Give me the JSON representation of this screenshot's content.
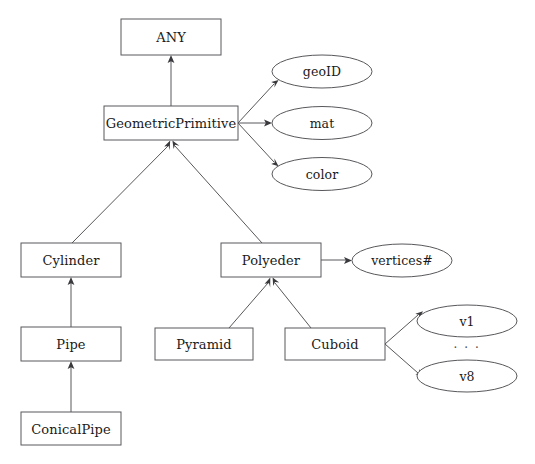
{
  "diagram": {
    "type": "class-hierarchy-diagram",
    "background_color": "#ffffff",
    "stroke_color": "#58585c",
    "text_color": "#1a1a1a",
    "classes": [
      {
        "id": "any",
        "label": "ANY",
        "x": 121,
        "y": 19,
        "w": 100,
        "h": 36
      },
      {
        "id": "geoprim",
        "label": "GeometricPrimitive",
        "x": 104,
        "y": 106,
        "w": 134,
        "h": 34
      },
      {
        "id": "cylinder",
        "label": "Cylinder",
        "x": 21,
        "y": 243,
        "w": 100,
        "h": 34
      },
      {
        "id": "polyeder",
        "label": "Polyeder",
        "x": 221,
        "y": 243,
        "w": 100,
        "h": 34
      },
      {
        "id": "pipe",
        "label": "Pipe",
        "x": 21,
        "y": 327,
        "w": 100,
        "h": 34
      },
      {
        "id": "pyramid",
        "label": "Pyramid",
        "x": 155,
        "y": 328,
        "w": 98,
        "h": 32
      },
      {
        "id": "cuboid",
        "label": "Cuboid",
        "x": 285,
        "y": 328,
        "w": 100,
        "h": 32
      },
      {
        "id": "conicalpipe",
        "label": "ConicalPipe",
        "x": 21,
        "y": 412,
        "w": 100,
        "h": 33
      }
    ],
    "attributes": [
      {
        "id": "geoid",
        "label": "geoID",
        "cx": 322,
        "cy": 71.5,
        "rx": 50,
        "ry": 16.5
      },
      {
        "id": "mat",
        "label": "mat",
        "cx": 322,
        "cy": 123,
        "rx": 50,
        "ry": 16.5
      },
      {
        "id": "color",
        "label": "color",
        "cx": 322,
        "cy": 174,
        "rx": 50,
        "ry": 16.5
      },
      {
        "id": "vertices",
        "label": "vertices#",
        "cx": 402,
        "cy": 260.5,
        "rx": 50,
        "ry": 16.5
      },
      {
        "id": "v1",
        "label": "v1",
        "cx": 467,
        "cy": 321,
        "rx": 50,
        "ry": 16
      },
      {
        "id": "v8",
        "label": "v8",
        "cx": 467,
        "cy": 376,
        "rx": 50,
        "ry": 16
      }
    ],
    "ellipsis": {
      "label": "· · ·",
      "x": 467,
      "y": 348
    },
    "inheritance_edges": [
      {
        "from": "geoprim",
        "to": "any"
      },
      {
        "from": "cylinder",
        "to": "geoprim"
      },
      {
        "from": "polyeder",
        "to": "geoprim"
      },
      {
        "from": "pipe",
        "to": "cylinder"
      },
      {
        "from": "pyramid",
        "to": "polyeder"
      },
      {
        "from": "cuboid",
        "to": "polyeder"
      },
      {
        "from": "conicalpipe",
        "to": "pipe"
      }
    ],
    "association_edges": [
      {
        "from": "geoprim",
        "to": "geoid"
      },
      {
        "from": "geoprim",
        "to": "mat"
      },
      {
        "from": "geoprim",
        "to": "color"
      },
      {
        "from": "polyeder",
        "to": "vertices"
      },
      {
        "from": "cuboid",
        "to": "v1"
      },
      {
        "from": "cuboid",
        "to": "v8"
      }
    ]
  }
}
